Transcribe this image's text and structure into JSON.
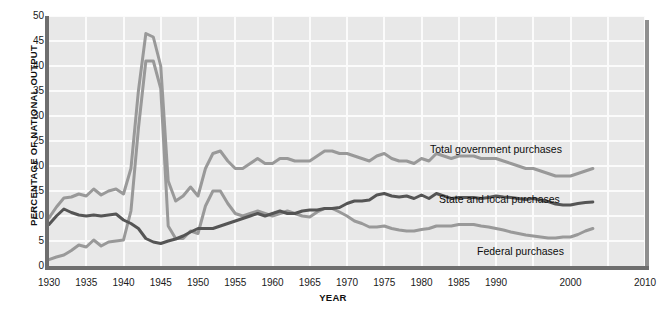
{
  "chart_data": {
    "type": "line",
    "title": "",
    "xlabel": "YEAR",
    "ylabel": "PERCENTAGE OF NATIONAL OUTPUT",
    "xlim": [
      1930,
      2010
    ],
    "ylim": [
      0,
      50
    ],
    "grid": true,
    "legend_position": "inline-annotations",
    "xticks": [
      "1930",
      "1935",
      "1940",
      "1945",
      "1950",
      "1955",
      "1960",
      "1965",
      "1970",
      "1975",
      "1980",
      "1985",
      "1990",
      "2000",
      "2010"
    ],
    "xtick_years": [
      1930,
      1935,
      1940,
      1945,
      1950,
      1955,
      1960,
      1965,
      1970,
      1975,
      1980,
      1985,
      1990,
      2000,
      2010
    ],
    "yticks": [
      "0",
      "5",
      "10",
      "15",
      "20",
      "25",
      "30",
      "35",
      "40",
      "45",
      "50"
    ],
    "ytick_values": [
      0,
      5,
      10,
      15,
      20,
      25,
      30,
      35,
      40,
      45,
      50
    ],
    "x": [
      1930,
      1931,
      1932,
      1933,
      1934,
      1935,
      1936,
      1937,
      1938,
      1939,
      1940,
      1941,
      1942,
      1943,
      1944,
      1945,
      1946,
      1947,
      1948,
      1949,
      1950,
      1951,
      1952,
      1953,
      1954,
      1955,
      1956,
      1957,
      1958,
      1959,
      1960,
      1961,
      1962,
      1963,
      1964,
      1965,
      1966,
      1967,
      1968,
      1969,
      1970,
      1971,
      1972,
      1973,
      1974,
      1975,
      1976,
      1977,
      1978,
      1979,
      1980,
      1981,
      1982,
      1983,
      1984,
      1985,
      1986,
      1987,
      1988,
      1989,
      1990,
      1991,
      1992,
      1993,
      1994,
      1995,
      1996,
      1997,
      1998,
      1999,
      2000,
      2001,
      2002,
      2003
    ],
    "series": [
      {
        "name": "Total government purchases",
        "color": "#999999",
        "values": [
          9.6,
          11.8,
          13.6,
          13.8,
          14.4,
          14.0,
          15.4,
          14.2,
          15.0,
          15.4,
          14.4,
          19.5,
          35.0,
          46.5,
          45.8,
          40.0,
          17.0,
          13.0,
          14.0,
          15.8,
          14.0,
          19.5,
          22.5,
          23.0,
          21.0,
          19.5,
          19.5,
          20.5,
          21.5,
          20.5,
          20.5,
          21.5,
          21.5,
          21.0,
          21.0,
          21.0,
          22.0,
          23.0,
          23.0,
          22.5,
          22.5,
          22.0,
          21.5,
          21.0,
          22.0,
          22.5,
          21.5,
          21.0,
          21.0,
          20.5,
          21.5,
          21.0,
          22.5,
          22.0,
          21.5,
          22.0,
          22.0,
          22.0,
          21.5,
          21.5,
          21.5,
          21.0,
          20.5,
          20.0,
          19.5,
          19.5,
          19.0,
          18.5,
          18.0,
          18.0,
          18.0,
          18.5,
          19.0,
          19.5
        ]
      },
      {
        "name": "Federal purchases",
        "color": "#999999",
        "values": [
          1.3,
          1.8,
          2.2,
          3.1,
          4.2,
          3.8,
          5.2,
          4.0,
          4.8,
          5.0,
          5.2,
          11.0,
          27.5,
          41.0,
          41.0,
          35.5,
          8.0,
          5.5,
          5.5,
          7.0,
          6.5,
          12.0,
          15.0,
          15.0,
          12.5,
          10.5,
          10.0,
          10.5,
          11.0,
          10.5,
          10.0,
          10.5,
          11.0,
          10.5,
          10.0,
          9.8,
          10.8,
          11.5,
          11.5,
          10.8,
          10.0,
          9.0,
          8.5,
          7.8,
          7.8,
          8.0,
          7.5,
          7.2,
          7.0,
          7.0,
          7.3,
          7.5,
          8.0,
          8.0,
          8.0,
          8.3,
          8.3,
          8.3,
          8.0,
          7.8,
          7.5,
          7.2,
          6.8,
          6.5,
          6.2,
          6.0,
          5.8,
          5.6,
          5.6,
          5.8,
          5.8,
          6.3,
          7.0,
          7.5
        ]
      },
      {
        "name": "State and local purchases",
        "color": "#555555",
        "values": [
          8.3,
          10.0,
          11.4,
          10.7,
          10.2,
          10.0,
          10.2,
          10.0,
          10.2,
          10.4,
          9.2,
          8.5,
          7.5,
          5.5,
          4.8,
          4.5,
          5.0,
          5.4,
          6.0,
          6.8,
          7.5,
          7.5,
          7.5,
          8.0,
          8.5,
          9.0,
          9.5,
          10.0,
          10.5,
          10.0,
          10.5,
          11.0,
          10.5,
          10.5,
          11.0,
          11.2,
          11.2,
          11.5,
          11.5,
          11.7,
          12.5,
          13.0,
          13.0,
          13.2,
          14.2,
          14.5,
          14.0,
          13.8,
          14.0,
          13.5,
          14.2,
          13.5,
          14.5,
          14.0,
          13.5,
          13.7,
          13.7,
          13.7,
          13.5,
          13.7,
          14.0,
          13.8,
          13.7,
          13.5,
          13.3,
          13.5,
          13.2,
          12.9,
          12.4,
          12.2,
          12.2,
          12.5,
          12.7,
          12.8
        ]
      }
    ],
    "annotations": [
      {
        "text": "Total government purchases",
        "x_px": 430,
        "y_px": 143
      },
      {
        "text": "State and local purchases",
        "x_px": 439,
        "y_px": 193
      },
      {
        "text": "Federal purchases",
        "x_px": 477,
        "y_px": 245
      }
    ]
  }
}
